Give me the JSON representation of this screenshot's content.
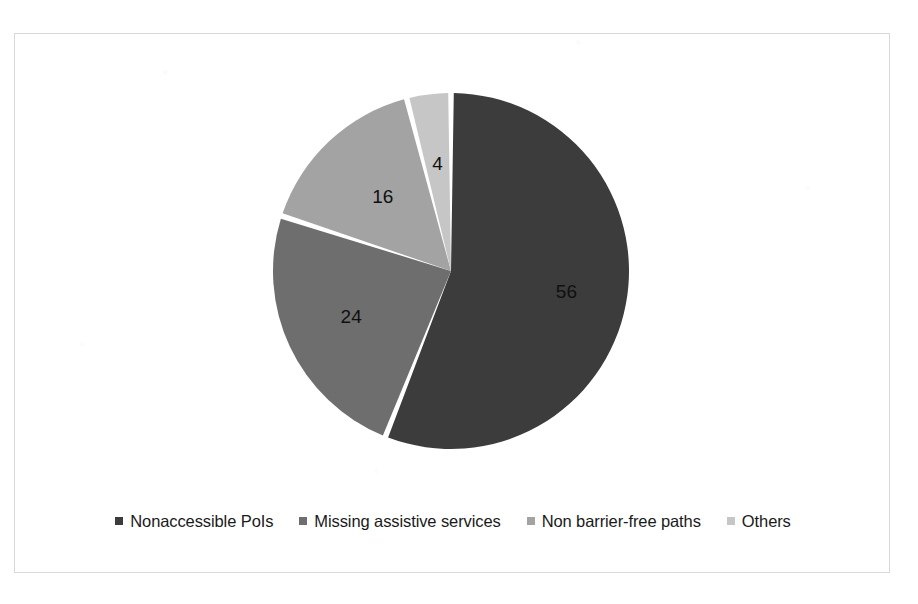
{
  "chart_data": {
    "type": "pie",
    "title": "",
    "categories": [
      "Nonaccessible PoIs",
      "Missing assistive services",
      "Non barrier-free paths",
      "Others"
    ],
    "values": [
      56,
      24,
      16,
      4
    ],
    "labels": [
      "56",
      "24",
      "16",
      "4"
    ],
    "colors": [
      "#3c3c3c",
      "#6e6e6e",
      "#a3a3a3",
      "#c6c6c6"
    ],
    "total": 100,
    "start_angle_deg": 0,
    "direction": "clockwise",
    "legend_position": "bottom",
    "grid": false,
    "slice_gap": true,
    "slices": [
      {
        "label": "Nonaccessible PoIs",
        "value": 56,
        "display": "56",
        "color": "#3c3c3c"
      },
      {
        "label": "Missing assistive services",
        "value": 24,
        "display": "24",
        "color": "#6e6e6e"
      },
      {
        "label": "Non barrier-free paths",
        "value": 16,
        "display": "16",
        "color": "#a3a3a3"
      },
      {
        "label": "Others",
        "value": 4,
        "display": "4",
        "color": "#c6c6c6"
      }
    ]
  },
  "legend": {
    "items": [
      {
        "label": "Nonaccessible PoIs",
        "color": "#3c3c3c"
      },
      {
        "label": "Missing assistive services",
        "color": "#6e6e6e"
      },
      {
        "label": "Non barrier-free paths",
        "color": "#a3a3a3"
      },
      {
        "label": "Others",
        "color": "#c6c6c6"
      }
    ]
  },
  "frame": {
    "border_color": "#d9d9d9",
    "background": "#ffffff"
  }
}
